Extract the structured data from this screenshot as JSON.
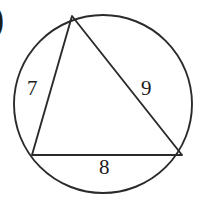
{
  "figure": {
    "background_color": "#ffffff",
    "stroke_color": "#2b2b2b",
    "label_color": "#1c1c1c",
    "corner_glyph": ")"
  },
  "circle": {
    "center_x": 103,
    "center_y": 104,
    "radius": 89
  },
  "triangle": {
    "vertices": [
      {
        "name": "top",
        "x": 72,
        "y": 16
      },
      {
        "name": "bottom-left",
        "x": 32,
        "y": 155
      },
      {
        "name": "bottom-right",
        "x": 182,
        "y": 155
      }
    ]
  },
  "labels": {
    "side_a": "7",
    "side_b": "9",
    "side_c": "8"
  },
  "chart_data": {
    "type": "diagram",
    "shapes": [
      {
        "kind": "circle",
        "cx": 103,
        "cy": 104,
        "r": 89
      },
      {
        "kind": "polygon",
        "points": [
          [
            72,
            16
          ],
          [
            32,
            155
          ],
          [
            182,
            155
          ]
        ]
      }
    ],
    "annotations": [
      {
        "text": "7",
        "x": 34,
        "y": 89,
        "describes": "left side, from top vertex to bottom-left vertex"
      },
      {
        "text": "9",
        "x": 148,
        "y": 89,
        "describes": "right side, from top vertex to bottom-right vertex"
      },
      {
        "text": "8",
        "x": 106,
        "y": 168,
        "describes": "bottom side, from bottom-left vertex to bottom-right vertex"
      }
    ]
  }
}
